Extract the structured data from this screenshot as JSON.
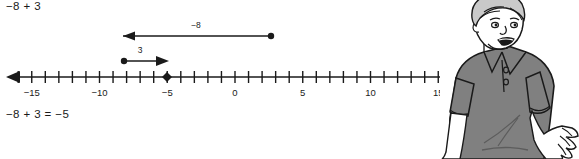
{
  "worked_example": {
    "problem_text": "−8 + 3",
    "answer_text": "−8 + 3 = −5"
  },
  "chart_data": {
    "type": "line",
    "title": "",
    "subtitle": "",
    "xlabel": "",
    "ylabel": "",
    "orientation": "horizontal",
    "grid": false,
    "legend": false,
    "axis": {
      "name": "number-line",
      "min": -16,
      "max": 16,
      "tick_step": 1,
      "labeled_ticks": [
        -15,
        -10,
        -5,
        0,
        5,
        10,
        15
      ],
      "tick_labels": [
        "−15",
        "−10",
        "−5",
        "0",
        "5",
        "10",
        "15"
      ],
      "left_arrow": true,
      "right_arrow": true
    },
    "markers": [
      {
        "name": "solution-point",
        "value": -5,
        "label": "−5",
        "shape": "diamond"
      }
    ],
    "jumps": [
      {
        "name": "jump-minus-8",
        "label": "−8",
        "from": 3,
        "to": -5,
        "direction": "left",
        "row": 1,
        "start_dot": true,
        "end_arrow": true
      },
      {
        "name": "jump-plus-3",
        "label": "3",
        "from": -8,
        "to": -5,
        "direction": "right",
        "row": 2,
        "start_dot": true,
        "end_arrow": true
      }
    ],
    "values": [
      -8,
      3,
      -5
    ],
    "categories": [
      "start",
      "add",
      "result"
    ]
  },
  "illustration": {
    "name": "boy-shrugging",
    "description": "line-art boy in gray polo shirt, shrugging with open right hand",
    "shirt_color": "#808080",
    "outline_color": "#1a1a1a",
    "skin_color": "#ffffff"
  },
  "colors": {
    "ink": "#1a1a1a",
    "background": "#ffffff",
    "shirt": "#808080",
    "shirt_shadow": "#6e6e6e"
  }
}
